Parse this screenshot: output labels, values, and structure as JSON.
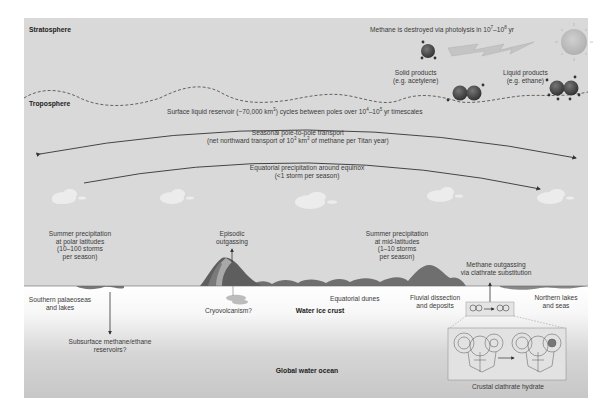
{
  "layers": {
    "stratosphere": "Stratosphere",
    "troposphere": "Troposphere",
    "crust": "Water ice crust",
    "ocean": "Global water ocean"
  },
  "photolysis": {
    "text_pre": "Methane is destroyed via photolysis in 10",
    "exp1": "7",
    "mid": "–10",
    "exp2": "8",
    "post": " yr"
  },
  "products": {
    "solid": [
      "Solid products",
      "(e.g. acetylene)"
    ],
    "liquid": [
      "Liquid products",
      "(e.g. ethane)"
    ]
  },
  "surface_reservoir": {
    "pre": "Surface liquid reservoir (~70,000 km",
    "exp": "3",
    "mid": ") cycles between poles over 10",
    "exp2": "4",
    "mid2": "–10",
    "exp3": "5",
    "post": " yr timescales"
  },
  "seasonal_transport": {
    "line1": "Seasonal pole-to-pole transport",
    "line2_pre": "(net northward transport of 10",
    "exp": "3",
    "line2_mid": " km",
    "exp2": "3",
    "line2_post": " of methane per Titan year)"
  },
  "equatorial_precip": {
    "line1": "Equatorial precipitation around equinox",
    "line2": "(<1 storm per season)"
  },
  "polar_precip": [
    "Summer precipitation",
    "at polar latitudes",
    "(10–100 storms",
    "per season)"
  ],
  "episodic": [
    "Episodic",
    "outgassing"
  ],
  "midlat_precip": [
    "Summer precipitation",
    "at mid-latitudes",
    "(1–10 storms",
    "per season)"
  ],
  "clathrate_outgassing": [
    "Methane outgassing",
    "via clathrate substitution"
  ],
  "surface_features": {
    "southern": [
      "Southern palaeoseas",
      "and lakes"
    ],
    "cryo": "Cryovolcanism?",
    "dunes": "Equatorial dunes",
    "fluvial": [
      "Fluvial dissection",
      "and deposits"
    ],
    "northern": [
      "Northern lakes",
      "and seas"
    ]
  },
  "subsurface": [
    "Subsurface methane/ethane",
    "reservoirs?"
  ],
  "clathrate_label": "Crustal clathrate hydrate",
  "colors": {
    "sky": "#d9d9d9",
    "terrain": "#6e6e6e",
    "sun": "#bdbdbd",
    "molecule": "#4a4a4a",
    "line": "#333333"
  }
}
